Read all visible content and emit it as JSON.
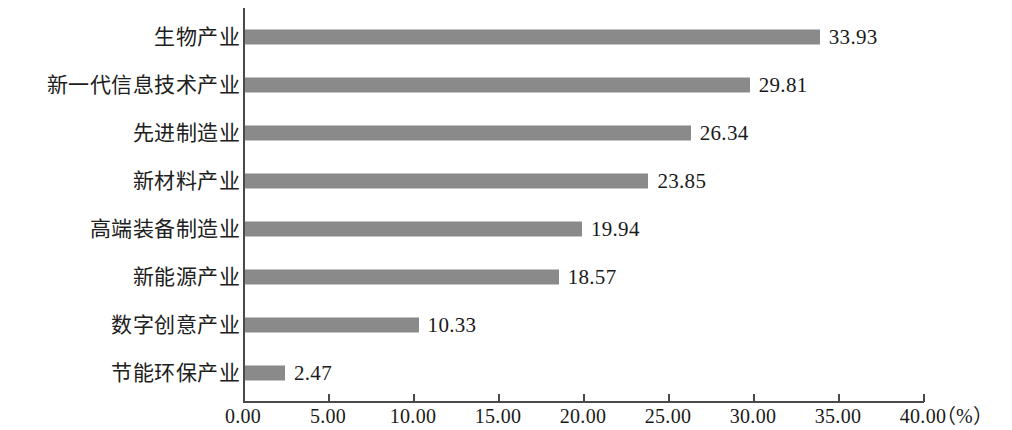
{
  "chart_data": {
    "type": "bar",
    "orientation": "horizontal",
    "title": "",
    "xlabel": "（%）",
    "ylabel": "",
    "xlim": [
      0,
      40
    ],
    "xticks": [
      "0.00",
      "5.00",
      "10.00",
      "15.00",
      "20.00",
      "25.00",
      "30.00",
      "35.00",
      "40.00"
    ],
    "xtick_values": [
      0,
      5,
      10,
      15,
      20,
      25,
      30,
      35,
      40
    ],
    "grid": false,
    "legend": false,
    "categories": [
      "生物产业",
      "新一代信息技术产业",
      "先进制造业",
      "新材料产业",
      "高端装备制造业",
      "新能源产业",
      "数字创意产业",
      "节能环保产业"
    ],
    "values": [
      33.93,
      29.81,
      26.34,
      23.85,
      19.94,
      18.57,
      10.33,
      2.47
    ],
    "value_labels": [
      "33.93",
      "29.81",
      "26.34",
      "23.85",
      "19.94",
      "18.57",
      "10.33",
      "2.47"
    ],
    "bar_color": "#8a8a8a",
    "axis_color": "#4a4a4a",
    "background_color": "#ffffff",
    "unit": "%"
  }
}
